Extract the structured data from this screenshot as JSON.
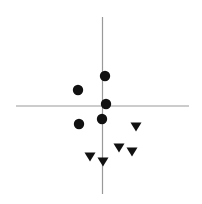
{
  "chart_data": {
    "type": "scatter",
    "title": "",
    "xlabel": "",
    "ylabel": "",
    "grid": false,
    "legend": null,
    "axes": {
      "style": "crosshair",
      "color": "#999999",
      "horizontal": {
        "x1": 16,
        "x2": 189,
        "y": 106
      },
      "vertical": {
        "x": 102.5,
        "y1": 17,
        "y2": 194
      }
    },
    "xlim": [
      -1,
      1
    ],
    "ylim": [
      -1,
      1
    ],
    "series": [
      {
        "name": "circles",
        "marker": "circle",
        "color": "#111111",
        "points_px": [
          {
            "x": 105,
            "y": 76
          },
          {
            "x": 78,
            "y": 90
          },
          {
            "x": 106,
            "y": 104
          },
          {
            "x": 102,
            "y": 119
          },
          {
            "x": 79,
            "y": 124
          }
        ],
        "points": [
          {
            "x": 0.03,
            "y": 0.34
          },
          {
            "x": -0.28,
            "y": 0.18
          },
          {
            "x": 0.04,
            "y": 0.02
          },
          {
            "x": -0.01,
            "y": -0.15
          },
          {
            "x": -0.27,
            "y": -0.2
          }
        ]
      },
      {
        "name": "triangles",
        "marker": "triangle-down",
        "color": "#111111",
        "points_px": [
          {
            "x": 136,
            "y": 127
          },
          {
            "x": 119,
            "y": 148
          },
          {
            "x": 132,
            "y": 152
          },
          {
            "x": 90,
            "y": 157
          },
          {
            "x": 103,
            "y": 162
          }
        ],
        "points": [
          {
            "x": 0.39,
            "y": -0.24
          },
          {
            "x": 0.19,
            "y": -0.47
          },
          {
            "x": 0.34,
            "y": -0.52
          },
          {
            "x": -0.14,
            "y": -0.58
          },
          {
            "x": 0.01,
            "y": -0.63
          }
        ]
      }
    ]
  }
}
